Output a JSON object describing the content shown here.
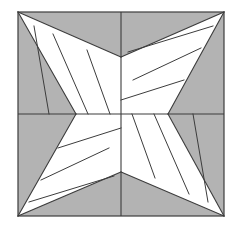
{
  "figure": {
    "description": "A square frame divided by a central horizontal and vertical axis into four quadrants. Each quadrant contains a white triangular wedge forming a four-pointed pinwheel/star, subdivided by straight internal lines, set against a gray background.",
    "canvas": {
      "width": 238,
      "height": 229
    },
    "colors": {
      "background": "#ffffff",
      "gray_fill": "#b3b3b3",
      "white_fill": "#ffffff",
      "line": "#3c3c3c"
    },
    "frame": {
      "left": 18,
      "top": 12,
      "right": 224,
      "bottom": 216
    },
    "axes": {
      "center_x": 121,
      "center_y": 114
    },
    "pinch_points": {
      "top": {
        "x": 121,
        "y": 57
      },
      "bottom": {
        "x": 121,
        "y": 172
      },
      "left": {
        "x": 76,
        "y": 114
      },
      "right": {
        "x": 168,
        "y": 114
      }
    },
    "corners": {
      "top_left": {
        "x": 18,
        "y": 12
      },
      "top_right": {
        "x": 224,
        "y": 12
      },
      "bottom_left": {
        "x": 18,
        "y": 216
      },
      "bottom_right": {
        "x": 224,
        "y": 216
      }
    },
    "quadrants": [
      {
        "name": "top-left",
        "white_wedge": "18,12 121,57 76,114",
        "dividers": [
          "34,26 76,114",
          "53,34 88,114",
          "87,50 110,114"
        ]
      },
      {
        "name": "top-right",
        "white_wedge": "224,12 168,114 121,57",
        "dividers": [
          "213,26 121,57",
          "201,48 136,86",
          "184,80 121,100"
        ]
      },
      {
        "name": "bottom-left",
        "white_wedge": "18,216 76,114 121,172",
        "dividers": [
          "29,202 121,172",
          "41,180 106,142",
          "58,148 121,128"
        ]
      },
      {
        "name": "bottom-right",
        "white_wedge": "224,216 121,172 168,114"
      }
    ],
    "white_polygons": [
      {
        "name": "tl-wedge-piece-1",
        "points": "18,12 34,26 76,114"
      },
      {
        "name": "tl-wedge-piece-2",
        "points": "34,26 53,34 88,114 76,114"
      },
      {
        "name": "tl-wedge-piece-3",
        "points": "53,34 87,50 110,114 88,114"
      },
      {
        "name": "tl-wedge-piece-4",
        "points": "87,50 121,57 121,114 110,114"
      },
      {
        "name": "tr-wedge-piece-1",
        "points": "224,12 213,26 121,57"
      },
      {
        "name": "tr-wedge-piece-2",
        "points": "213,26 201,48 136,86 121,57"
      },
      {
        "name": "tr-wedge-piece-3",
        "points": "201,48 184,80 121,100 136,86"
      },
      {
        "name": "tr-wedge-piece-4",
        "points": "184,80 168,114 121,114 121,100"
      },
      {
        "name": "bl-wedge-piece-1",
        "points": "18,216 29,202 121,172"
      },
      {
        "name": "bl-wedge-piece-2",
        "points": "29,202 41,180 106,142 121,172"
      },
      {
        "name": "bl-wedge-piece-3",
        "points": "41,180 58,148 121,128 106,142"
      },
      {
        "name": "bl-wedge-piece-4",
        "points": "58,148 76,114 121,114 121,128"
      },
      {
        "name": "br-wedge-piece-1",
        "points": "224,216 235,202 121,172"
      },
      {
        "name": "br-wedge-piece-2",
        "points": "224,216 209,190 137,120 168,114"
      },
      {
        "name": "br-wedge-piece-3",
        "points": "121,172 159,120 137,120"
      },
      {
        "name": "br-wedge-piece-4",
        "points": "121,172 121,114 137,120"
      }
    ],
    "line_segments": [
      {
        "name": "frame-top",
        "x1": 18,
        "y1": 12,
        "x2": 224,
        "y2": 12
      },
      {
        "name": "frame-right",
        "x1": 224,
        "y1": 12,
        "x2": 224,
        "y2": 216
      },
      {
        "name": "frame-bottom",
        "x1": 224,
        "y1": 216,
        "x2": 18,
        "y2": 216
      },
      {
        "name": "frame-left",
        "x1": 18,
        "y1": 216,
        "x2": 18,
        "y2": 12
      },
      {
        "name": "axis-horizontal",
        "x1": 18,
        "y1": 114,
        "x2": 224,
        "y2": 114
      },
      {
        "name": "axis-vertical",
        "x1": 121,
        "y1": 12,
        "x2": 121,
        "y2": 216
      }
    ]
  }
}
